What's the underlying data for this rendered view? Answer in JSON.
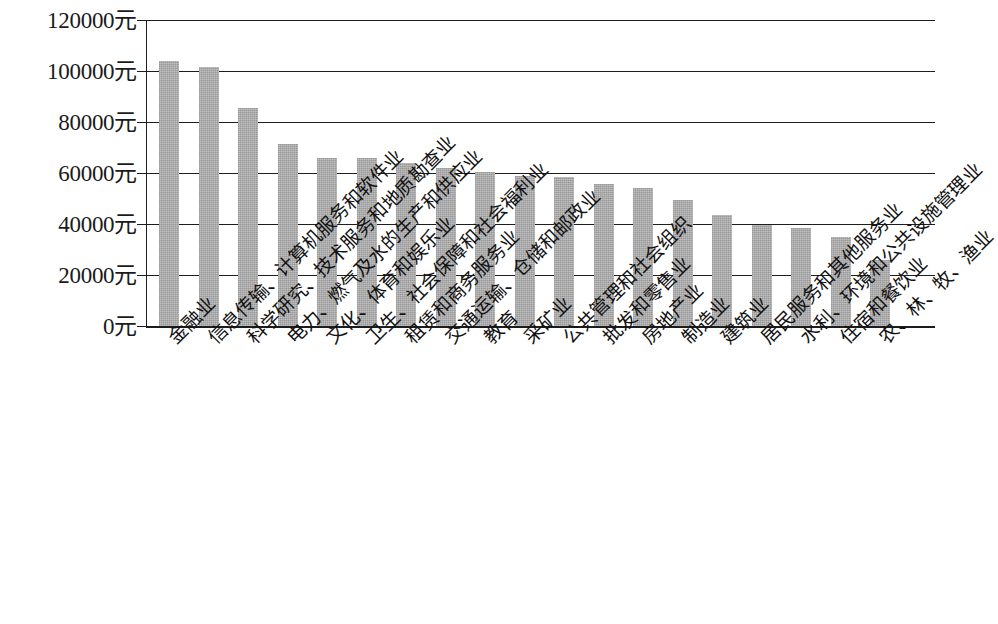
{
  "chart_data": {
    "type": "bar",
    "title": "",
    "xlabel": "",
    "ylabel": "",
    "ylim": [
      0,
      120000
    ],
    "ytick_labels": [
      "120000元",
      "100000元",
      "80000元",
      "60000元",
      "40000元",
      "20000元",
      "0元"
    ],
    "ytick_values": [
      120000,
      100000,
      80000,
      60000,
      40000,
      20000,
      0
    ],
    "yunit": "元",
    "grid": true,
    "legend": "none",
    "bar_color": "#a9a9a9",
    "axis_color": "#1d1d1d",
    "categories": [
      "金融业",
      "信息传输、计算机服务和软件业",
      "科学研究、技术服务和地质勘查业",
      "电力、燃气及水的生产和供应业",
      "文化、体育和娱乐业",
      "卫生、社会保障和社会福利业",
      "租赁和商务服务业",
      "交通运输、仓储和邮政业",
      "教育",
      "采矿业",
      "公共管理和社会组织",
      "批发和零售业",
      "房地产业",
      "制造业",
      "建筑业",
      "居民服务和其他服务业",
      "水利、环境和公共设施管理业",
      "住宿和餐饮业",
      "农、林、牧、渔业"
    ],
    "values": [
      104000,
      101500,
      85500,
      71500,
      66000,
      66000,
      64000,
      62000,
      60500,
      59000,
      58500,
      55500,
      54000,
      49500,
      43500,
      39500,
      38500,
      35000,
      26000
    ],
    "series": [
      {
        "name": "平均工资",
        "values": [
          104000,
          101500,
          85500,
          71500,
          66000,
          66000,
          64000,
          62000,
          60500,
          59000,
          58500,
          55500,
          54000,
          49500,
          43500,
          39500,
          38500,
          35000,
          26000
        ]
      }
    ]
  }
}
